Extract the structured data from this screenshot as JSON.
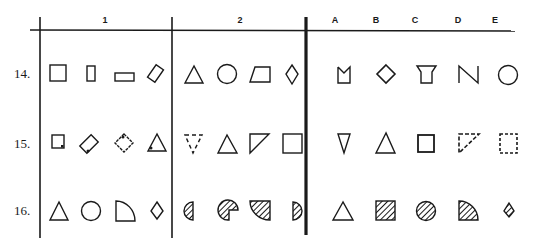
{
  "headers": {
    "group1": "1",
    "group2": "2",
    "answers": [
      "A",
      "B",
      "C",
      "D",
      "E"
    ]
  },
  "rows": [
    {
      "label": "14.",
      "group1": [
        "square",
        "tall-rectangle",
        "wide-rectangle",
        "tilted-rectangle"
      ],
      "group2": [
        "triangle",
        "circle",
        "trapezoid",
        "diamond"
      ],
      "answers": [
        "notched-rectangle",
        "diamond",
        "inverted-trapezoid",
        "N-shape",
        "circle"
      ]
    },
    {
      "label": "15.",
      "group1": [
        "square-with-dot",
        "tilted-rectangle-with-dot",
        "diamond-with-dot",
        "triangle-with-dot"
      ],
      "group2": [
        "dashed-inverted-triangle",
        "triangle",
        "right-triangle",
        "square"
      ],
      "answers": [
        "inverted-triangle",
        "triangle",
        "square",
        "dashed-right-triangle",
        "dashed-square"
      ]
    },
    {
      "label": "16.",
      "group1": [
        "triangle",
        "circle",
        "quarter-circle",
        "kite"
      ],
      "group2": [
        "hatched-half-circle-left",
        "hatched-pacman",
        "hatched-quarter-circle",
        "hatched-half-circle-right"
      ],
      "answers": [
        "triangle",
        "hatched-square",
        "hatched-circle",
        "hatched-quarter-circle",
        "hatched-kite"
      ]
    }
  ]
}
